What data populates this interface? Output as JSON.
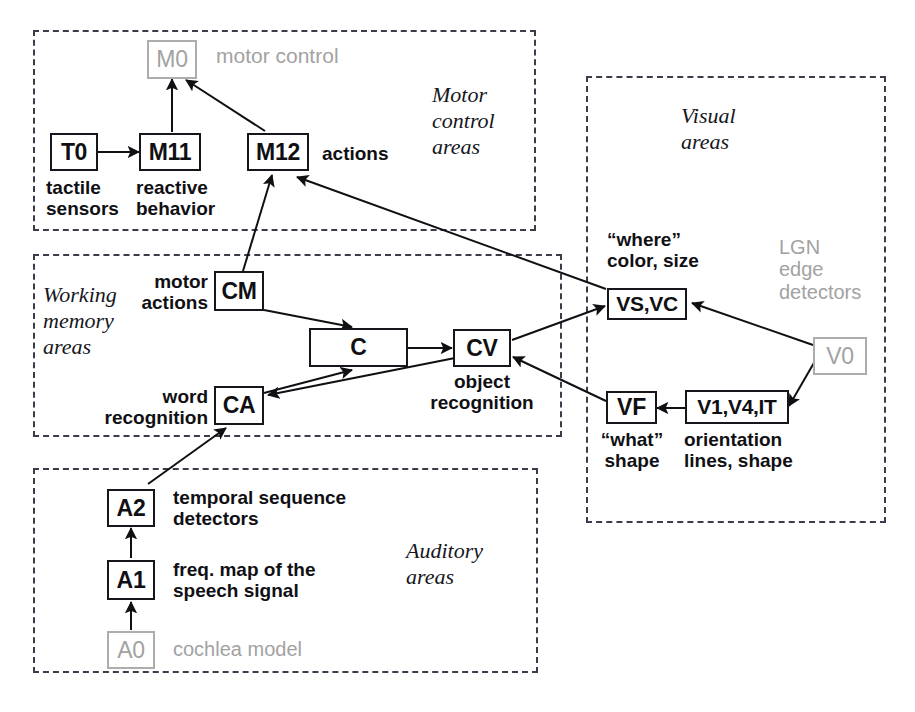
{
  "figure": {
    "bg_color": "#ffffff",
    "ink_color": "#101014",
    "dim_color": "#a2a2a2"
  },
  "groups": [
    {
      "id": "motor",
      "label": "Motor\ncontrol\nareas"
    },
    {
      "id": "working",
      "label": "Working\nmemory\nareas"
    },
    {
      "id": "auditory",
      "label": "Auditory\nareas"
    },
    {
      "id": "visual",
      "label": "Visual\nareas"
    }
  ],
  "nodes": [
    {
      "id": "M0",
      "label": "M0",
      "state": "dim"
    },
    {
      "id": "T0",
      "label": "T0",
      "state": "normal"
    },
    {
      "id": "M11",
      "label": "M11",
      "state": "normal"
    },
    {
      "id": "M12",
      "label": "M12",
      "state": "normal"
    },
    {
      "id": "CM",
      "label": "CM",
      "state": "normal"
    },
    {
      "id": "CA",
      "label": "CA",
      "state": "normal"
    },
    {
      "id": "C",
      "label": "C",
      "state": "normal"
    },
    {
      "id": "CV",
      "label": "CV",
      "state": "normal"
    },
    {
      "id": "VSVC",
      "label": "VS,VC",
      "state": "normal"
    },
    {
      "id": "VF",
      "label": "VF",
      "state": "normal"
    },
    {
      "id": "V1",
      "label": "V1,V4,IT",
      "state": "normal"
    },
    {
      "id": "V0",
      "label": "V0",
      "state": "dim"
    },
    {
      "id": "A2",
      "label": "A2",
      "state": "normal"
    },
    {
      "id": "A1",
      "label": "A1",
      "state": "normal"
    },
    {
      "id": "A0",
      "label": "A0",
      "state": "dim"
    }
  ],
  "captions": {
    "motor_control": "motor control",
    "tactile_sensors": "tactile\nsensors",
    "reactive_behavior": "reactive\nbehavior",
    "actions": "actions",
    "motor_actions": "motor\nactions",
    "word_recognition": "word\nrecognition",
    "object_recognition": "object\nrecognition",
    "where_color_size": "“where”\ncolor, size",
    "lgn_edge_detectors": "LGN\nedge\ndetectors",
    "what_shape": "“what”\nshape",
    "orientation_lines_shape": "orientation\nlines, shape",
    "temporal_sequence_detectors": "temporal sequence\ndetectors",
    "freq_map": "freq. map of the\nspeech signal",
    "cochlea_model": "cochlea model"
  },
  "edges": [
    {
      "from": "T0",
      "to": "M11"
    },
    {
      "from": "M11",
      "to": "M0"
    },
    {
      "from": "M12",
      "to": "M0"
    },
    {
      "from": "CM",
      "to": "M12"
    },
    {
      "from": "VSVC",
      "to": "M12"
    },
    {
      "from": "CM",
      "to": "C"
    },
    {
      "from": "CA",
      "to": "C"
    },
    {
      "from": "C",
      "to": "CV"
    },
    {
      "from": "CV",
      "to": "VSVC"
    },
    {
      "from": "CV",
      "to": "CA"
    },
    {
      "from": "VF",
      "to": "CV"
    },
    {
      "from": "V0",
      "to": "VSVC"
    },
    {
      "from": "V0",
      "to": "V1"
    },
    {
      "from": "V1",
      "to": "VF"
    },
    {
      "from": "A2",
      "to": "CA"
    },
    {
      "from": "A1",
      "to": "A2"
    },
    {
      "from": "A0",
      "to": "A1"
    }
  ]
}
